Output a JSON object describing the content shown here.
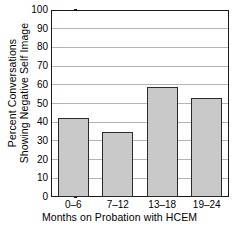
{
  "chart_data": {
    "type": "bar",
    "title": "",
    "categories": [
      "0–6",
      "7–12",
      "13–18",
      "19–24"
    ],
    "values": [
      42,
      35,
      59,
      53
    ],
    "xlabel": "Months on Probation with HCEM",
    "ylabel_line1": "Percent Conversations",
    "ylabel_line2": "Showing Negative Self Image",
    "ylim": [
      0,
      100
    ],
    "yticks": [
      0,
      10,
      20,
      30,
      40,
      50,
      60,
      70,
      80,
      90,
      100
    ],
    "ytick_labels": [
      "0",
      "10",
      "20",
      "30",
      "40",
      "50",
      "60",
      "70",
      "80",
      "90",
      "100"
    ],
    "grid": "horizontal",
    "legend": "none",
    "bar_fill_color": "#c9c9c9",
    "bar_edge_color": "#2b2b2b",
    "axis_color": "#1a1a1a",
    "grid_color": "#b4b4b4",
    "background_color": "#ffffff"
  }
}
